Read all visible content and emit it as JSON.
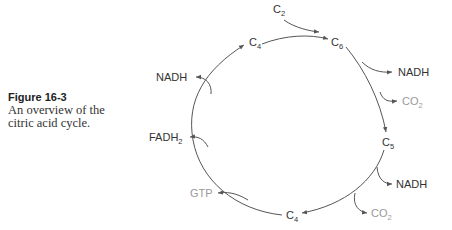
{
  "caption": {
    "label": "Figure 16-3",
    "text_line1": "An overview of the",
    "text_line2": "citric acid cycle."
  },
  "diagram": {
    "nodes": [
      {
        "id": "c2_input",
        "base": "C",
        "sub": "2"
      },
      {
        "id": "c6",
        "base": "C",
        "sub": "6"
      },
      {
        "id": "c5",
        "base": "C",
        "sub": "5"
      },
      {
        "id": "c4_bottom",
        "base": "C",
        "sub": "4"
      },
      {
        "id": "c4_top",
        "base": "C",
        "sub": "4"
      }
    ],
    "outputs": [
      {
        "id": "nadh_1",
        "label": "NADH",
        "from": "c6"
      },
      {
        "id": "co2_1",
        "base": "CO",
        "sub": "2",
        "from": "c6"
      },
      {
        "id": "nadh_2",
        "label": "NADH",
        "from": "c5"
      },
      {
        "id": "co2_2",
        "base": "CO",
        "sub": "2",
        "from": "c5"
      },
      {
        "id": "gtp",
        "label": "GTP",
        "from": "c4_bottom"
      },
      {
        "id": "fadh2",
        "base": "FADH",
        "sub": "2",
        "from": "c4_bottom"
      },
      {
        "id": "nadh_3",
        "label": "NADH",
        "from": "c4_bottom"
      }
    ],
    "colors": {
      "line": "#555555",
      "text": "#333333",
      "muted_text": "#999999"
    }
  }
}
